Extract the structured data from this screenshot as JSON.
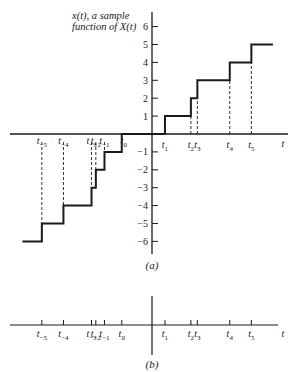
{
  "figure": {
    "annotation_line1": "x(t), a sample",
    "annotation_line2": "function of X(t)",
    "caption_a": "(a)",
    "caption_b": "(b)",
    "axis_label_t": "t"
  },
  "chart_data": {
    "type": "line",
    "subtype": "step",
    "title": "x(t), a sample function of X(t)",
    "xlabel": "t",
    "ylabel": "",
    "ylim": [
      -6,
      6
    ],
    "yticks": [
      -6,
      -5,
      -4,
      -3,
      -2,
      -1,
      1,
      2,
      3,
      4,
      5,
      6
    ],
    "event_times": [
      {
        "label": "t",
        "sub": "-5",
        "value": -5.1
      },
      {
        "label": "t",
        "sub": "-4",
        "value": -4.1
      },
      {
        "label": "t",
        "sub": "-3",
        "value": -2.8
      },
      {
        "label": "t",
        "sub": "-2",
        "value": -2.6
      },
      {
        "label": "t",
        "sub": "-1",
        "value": -2.2
      },
      {
        "label": "t",
        "sub": "0",
        "value": -1.4
      },
      {
        "label": "t",
        "sub": "1",
        "value": 0.6
      },
      {
        "label": "t",
        "sub": "2",
        "value": 1.8
      },
      {
        "label": "t",
        "sub": "3",
        "value": 2.1
      },
      {
        "label": "t",
        "sub": "4",
        "value": 3.6
      },
      {
        "label": "t",
        "sub": "5",
        "value": 4.6
      }
    ],
    "series": [
      {
        "name": "x(t)",
        "steps": [
          {
            "from": -6.0,
            "to": -5.1,
            "value": -6
          },
          {
            "from": -5.1,
            "to": -4.1,
            "value": -5
          },
          {
            "from": -4.1,
            "to": -2.8,
            "value": -4
          },
          {
            "from": -2.8,
            "to": -2.6,
            "value": -3
          },
          {
            "from": -2.6,
            "to": -2.2,
            "value": -2
          },
          {
            "from": -2.2,
            "to": -1.4,
            "value": -1
          },
          {
            "from": -1.4,
            "to": 0.6,
            "value": 0
          },
          {
            "from": 0.6,
            "to": 1.8,
            "value": 1
          },
          {
            "from": 1.8,
            "to": 2.1,
            "value": 2
          },
          {
            "from": 2.1,
            "to": 3.6,
            "value": 3
          },
          {
            "from": 3.6,
            "to": 4.6,
            "value": 4
          },
          {
            "from": 4.6,
            "to": 5.6,
            "value": 5
          }
        ]
      }
    ],
    "panels": [
      "(a) sample function with step jumps at event times",
      "(b) event times on time axis"
    ],
    "grid": false
  }
}
